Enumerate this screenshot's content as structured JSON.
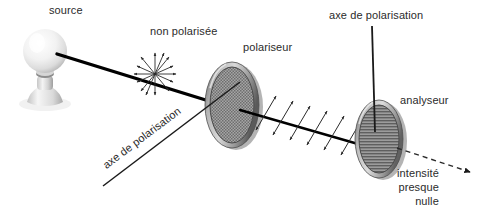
{
  "figure": {
    "title_alt": "Polarisation de la lumiere : source, polariseur, analyseur",
    "background_color": "#ffffff"
  },
  "labels": {
    "source": "source",
    "non_polarisee": "non polarisée",
    "polariseur": "polariseur",
    "axe_de_polarisation_top": "axe de polarisation",
    "axe_de_polarisation_diagonal": "axe de polarisation",
    "analyseur": "analyseur",
    "intensite_line1": "intensité",
    "intensite_line2": "presque",
    "intensite_line3": "nulle"
  },
  "colors": {
    "text": "#2b2b2b",
    "beam": "#000000",
    "rim_dark": "#6f6f6f",
    "rim_light": "#c9c9c9",
    "bulb_light": "#fdfdfd",
    "bulb_shadow": "#bdbdbd",
    "mesh": "#8a8a8a",
    "dashed_ray": "#3a3a3a"
  },
  "elements": {
    "lamp": "incandescent-bulb-on-stand",
    "beam": "light-ray-from-source-to-polariser",
    "unpolarised_symbol": "radial-double-headed-arrow-starburst",
    "polarised_symbol": "parallel-double-headed-arrows",
    "polariser_disk": "tilted-disk-with-cross-hatch-mesh",
    "analyser_disk": "tilted-disk-with-horizontal-striations",
    "axis_line_vertical": "vertical-polarisation-axis-line",
    "axis_line_diagonal": "diagonal-polarisation-axis-line",
    "exit_ray": "dashed-arrow-near-zero-intensity"
  }
}
